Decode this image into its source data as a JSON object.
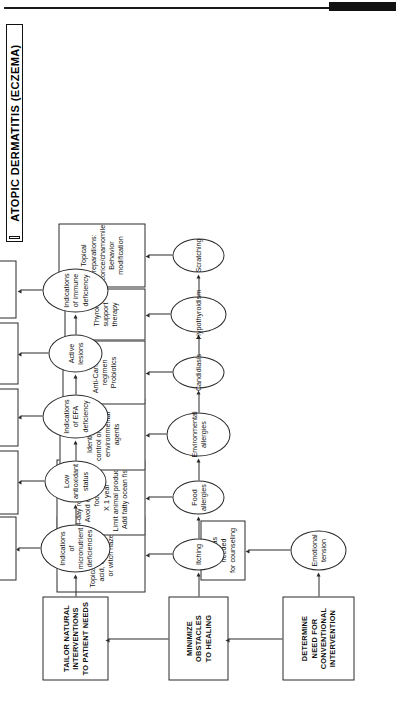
{
  "document": {
    "title": "ATOPIC DERMATITIS (ECZEMA)",
    "type": "clinical-algorithm-flowchart"
  },
  "header_rule": {
    "black_block": ""
  },
  "stages": [
    {
      "id": "determine",
      "label": "DETERMINE\nNEED FOR\nCONVENTIONAL\nINTERVENTION"
    },
    {
      "id": "minimize",
      "label": "MINIMIZE\nOBSTACLES\nTO HEALING"
    },
    {
      "id": "tailor",
      "label": "TAILOR NATURAL\nINTERVENTIONS\nTO PATIENT NEEDS"
    }
  ],
  "row_determine": {
    "findings": [
      {
        "id": "emotional-tension",
        "label": "Emotional\ntension"
      }
    ],
    "actions": [
      {
        "id": "refer-counseling",
        "label": "Refer as needed\nfor counseling",
        "italic": false
      }
    ]
  },
  "row_minimize": {
    "findings": [
      {
        "id": "itching",
        "label": "Itching"
      },
      {
        "id": "food-allergies",
        "label": "Food\nallergies"
      },
      {
        "id": "env-allergies",
        "label": "Environmental\nallergies"
      },
      {
        "id": "candidiasis",
        "label": "Candidiasis"
      },
      {
        "id": "hypothyroidism",
        "label": "Hypothyroidism"
      },
      {
        "id": "scratching",
        "label": "Scratching"
      }
    ],
    "actions": [
      {
        "id": "topical-glycyrrhetinic",
        "label": "Topical glycyrrhetinic\nacid, chamomile,\nor witch hazel",
        "italic": false
      },
      {
        "id": "rotation-diet",
        "label": "4-day rotation diet\nAvoid offending foods\nX 1 year\nLimit animal products\nAdd fatty ocean fish",
        "italic": false
      },
      {
        "id": "environmental-control",
        "label": "Identify and\ncontrol offending\nenvironmental agents",
        "italic": false
      },
      {
        "id": "anti-candida",
        "label": "Anti-Candida regimen\nProbiotics",
        "italic": false
      },
      {
        "id": "thyroid-support",
        "label": "Thyroid support therapy",
        "italic": false
      },
      {
        "id": "topical-preparations",
        "label": "Topical preparations:\nLicorice/chamomile\nBehavior modification",
        "italic": false
      }
    ]
  },
  "row_tailor": {
    "findings": [
      {
        "id": "micronutrient-deficiencies",
        "label": "Indications of\nmicronutrient\ndeficiencies"
      },
      {
        "id": "low-antioxidant",
        "label": "Low\nantioxidant\nstatus"
      },
      {
        "id": "efa-deficiency",
        "label": "Indications\nof EFA\ndeficiency"
      },
      {
        "id": "active-lesions",
        "label": "Active\nlesions"
      },
      {
        "id": "immune-deficiency",
        "label": "Indications\nof immune\ndeficiency"
      }
    ],
    "actions": [
      {
        "id": "vitamins-zinc",
        "label": "Vitamin A\nVitamin E\nZinc",
        "italic": false
      },
      {
        "id": "quercetin",
        "label": "Quercetin\nFlavonoid extracts",
        "italic": false
      },
      {
        "id": "epa-dha",
        "label": "EPA/DHA\nFlaxseed oil",
        "italic": false
      },
      {
        "id": "coleus-ginkgo",
        "label": "Coleus, Ginkgo\nLicorice (internal)\nChinese herbal formula",
        "italic": true
      },
      {
        "id": "burdock",
        "label": "Burdock or\ndandelion",
        "italic": false
      }
    ]
  },
  "colors": {
    "stroke": "#2a2a2a",
    "text": "#111111",
    "background": "#ffffff",
    "header_block": "#111111"
  }
}
